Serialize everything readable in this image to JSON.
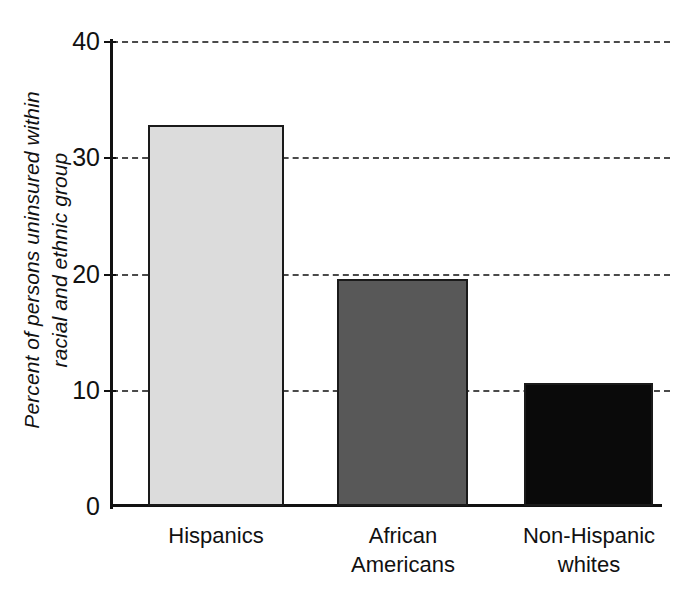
{
  "chart_data": {
    "type": "bar",
    "title": "",
    "subtitle": "",
    "xlabel": "",
    "ylabel": "Percent of persons uninsured within racial and ethnic group",
    "ylabel_line1": "Percent of persons uninsured within",
    "ylabel_line2": "racial and ethnic group",
    "categories": [
      "Hispanics",
      "African Americans",
      "Non-Hispanic whites"
    ],
    "category_lines": [
      [
        "Hispanics"
      ],
      [
        "African",
        "Americans"
      ],
      [
        "Non-Hispanic",
        "whites"
      ]
    ],
    "values": [
      32.8,
      19.5,
      10.6
    ],
    "ylim": [
      0,
      40
    ],
    "yticks": [
      0,
      10,
      20,
      30,
      40
    ],
    "ytick_labels": [
      "0",
      "10",
      "20",
      "30",
      "40"
    ],
    "grid": "horizontal-dashed",
    "legend": "none",
    "bar_colors": [
      "#dcdcdc",
      "#585858",
      "#0a0a0a"
    ],
    "bar_border_color": "#1a1a1a",
    "axis_color": "#111111",
    "gridline_color": "#4a4a4a",
    "background": "#ffffff",
    "annotations": []
  }
}
